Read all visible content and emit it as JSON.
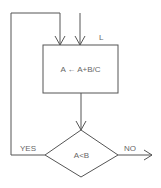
{
  "diagram": {
    "type": "flowchart",
    "colors": {
      "line": "#555555",
      "text": "#666666",
      "background": "#ffffff"
    },
    "nodes": [
      {
        "id": "process",
        "shape": "rectangle",
        "text": "A ← A+B/C",
        "label": "L"
      },
      {
        "id": "decision",
        "shape": "diamond",
        "text": "A<B"
      }
    ],
    "edges": [
      {
        "from": "entry",
        "to": "process",
        "label": ""
      },
      {
        "from": "process",
        "to": "decision",
        "label": ""
      },
      {
        "from": "decision",
        "to": "process",
        "label": "YES"
      },
      {
        "from": "decision",
        "to": "exit",
        "label": "NO"
      }
    ]
  },
  "labels": {
    "process_text": "A ← A+B/C",
    "process_tag": "L",
    "decision_text": "A<B",
    "yes": "YES",
    "no": "NO"
  }
}
